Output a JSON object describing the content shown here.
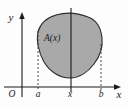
{
  "figure": {
    "kind": "calculus-cross-section-diagram",
    "background_color": "#fdfdfd",
    "axes": {
      "y_axis_label": "y",
      "x_axis_label": "x",
      "origin_label": "O",
      "axis_color": "#1a1a1a",
      "origin_px": {
        "x": 22,
        "y": 87
      }
    },
    "region": {
      "label": "A(x)",
      "fill_color": "#a9a9a9",
      "stroke_color": "#2b2b2b",
      "label_px": {
        "x": 44,
        "y": 41
      }
    },
    "markers": [
      {
        "name": "left-bound",
        "label": "a",
        "x_px": 38,
        "line_style": "dashed",
        "top_px": 31
      },
      {
        "name": "cross-section",
        "label": "x",
        "x_px": 71,
        "line_style": "solid",
        "top_px": 8
      },
      {
        "name": "right-bound",
        "label": "b",
        "x_px": 101,
        "line_style": "dashed",
        "top_px": 46
      }
    ],
    "tick_labels": [
      {
        "text": "O",
        "x_px": 12,
        "y_px": 95
      },
      {
        "text": "a",
        "x_px": 35,
        "y_px": 95
      },
      {
        "text": "x",
        "x_px": 68,
        "y_px": 95
      },
      {
        "text": "b",
        "x_px": 98,
        "y_px": 95
      },
      {
        "text": "x",
        "x_px": 118,
        "y_px": 93
      },
      {
        "text": "y",
        "x_px": 11,
        "y_px": 21
      }
    ]
  }
}
